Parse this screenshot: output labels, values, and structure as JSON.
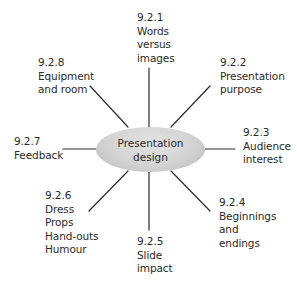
{
  "diagram": {
    "type": "mind-map",
    "center": {
      "lines": [
        "Presentation",
        "design"
      ]
    },
    "colors": {
      "line": "#2a2a2a",
      "ellipse_fill": "#d3d3d3",
      "text": "#2a2a2a"
    },
    "nodes": [
      {
        "id": "9.2.1",
        "lines": [
          "9.2.1",
          "Words",
          "versus",
          "images"
        ]
      },
      {
        "id": "9.2.2",
        "lines": [
          "9.2.2",
          "Presentation",
          "purpose"
        ]
      },
      {
        "id": "9.2.3",
        "lines": [
          "9.2.3",
          "Audience",
          "interest"
        ]
      },
      {
        "id": "9.2.4",
        "lines": [
          "9.2.4",
          "Beginnings",
          "and",
          "endings"
        ]
      },
      {
        "id": "9.2.5",
        "lines": [
          "9.2.5",
          "Slide",
          "impact"
        ]
      },
      {
        "id": "9.2.6",
        "lines": [
          "9.2.6",
          "Dress",
          "Props",
          "Hand-outs",
          "Humour"
        ]
      },
      {
        "id": "9.2.7",
        "lines": [
          "9.2.7",
          "Feedback"
        ]
      },
      {
        "id": "9.2.8",
        "lines": [
          "9.2.8",
          "Equipment",
          "and room"
        ]
      }
    ]
  }
}
